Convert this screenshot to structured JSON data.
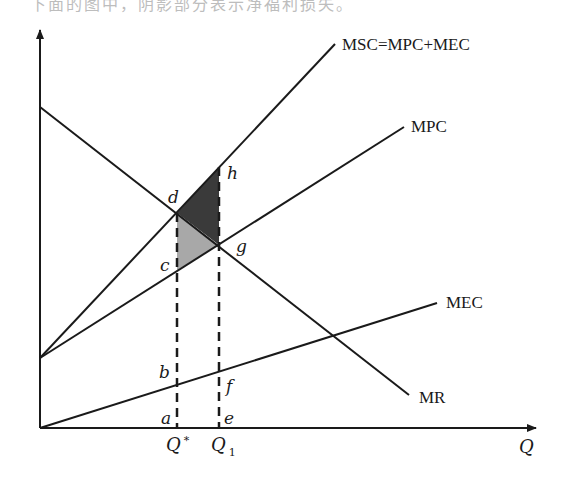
{
  "header": {
    "cut_off_text": "下面的图中，阴影部分表示净福利损失。"
  },
  "axes": {
    "x_label": "Q",
    "y_label": ""
  },
  "curves": {
    "msc": {
      "label": "MSC=MPC+MEC"
    },
    "mpc": {
      "label": "MPC"
    },
    "mec": {
      "label": "MEC"
    },
    "mr": {
      "label": "MR"
    }
  },
  "points": {
    "a": "a",
    "b": "b",
    "c": "c",
    "d": "d",
    "e": "e",
    "f": "f",
    "g": "g",
    "h": "h"
  },
  "ticks": {
    "q_star": "Q",
    "q_star_sup": "*",
    "q1": "Q",
    "q1_sub": "1"
  },
  "colors": {
    "line": "#1a1a1a",
    "dark_shade": "#3a3a3a",
    "light_shade": "#a8a8a8",
    "background": "#ffffff"
  },
  "geometry": {
    "origin": [
      40,
      428
    ],
    "y_axis_top": [
      40,
      28
    ],
    "x_axis_end": [
      538,
      428
    ],
    "msc_line": [
      [
        40,
        358
      ],
      [
        335,
        44
      ]
    ],
    "mpc_line": [
      [
        40,
        358
      ],
      [
        404,
        127
      ]
    ],
    "mr_line": [
      [
        40,
        107
      ],
      [
        409,
        395
      ]
    ],
    "mec_line": [
      [
        40,
        428
      ],
      [
        437,
        303
      ]
    ],
    "q_star_x": 177,
    "q1_x": 219,
    "point_d": [
      177,
      213
    ],
    "point_h": [
      219,
      167
    ],
    "point_g": [
      219,
      245
    ],
    "point_c": [
      177,
      270
    ]
  }
}
